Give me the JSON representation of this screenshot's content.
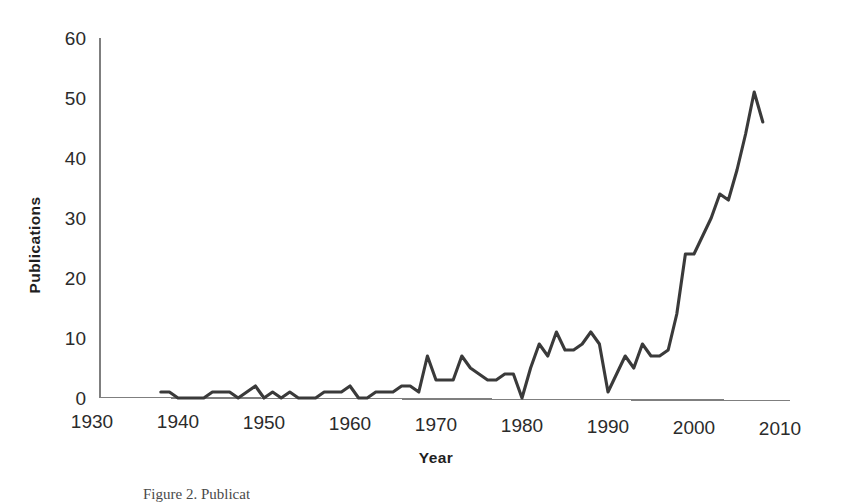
{
  "figure": {
    "caption": "Figure 2. Publicat",
    "background_color": "#ffffff"
  },
  "chart_data": {
    "type": "line",
    "title": "",
    "xlabel": "Year",
    "ylabel": "Publications",
    "xlim": [
      1930,
      2010
    ],
    "ylim": [
      0,
      60
    ],
    "grid": false,
    "legend": false,
    "line_color": "#3a3a3a",
    "axis_color": "#7f7f7f",
    "xticks": [
      1930,
      1940,
      1950,
      1960,
      1970,
      1980,
      1990,
      2000,
      2010
    ],
    "xtick_labels": [
      "1930",
      "1940",
      "1950",
      "1960",
      "1970",
      "1980",
      "1990",
      "2000",
      "2010"
    ],
    "yticks": [
      0,
      10,
      20,
      30,
      40,
      50,
      60
    ],
    "ytick_labels": [
      "0",
      "10",
      "20",
      "30",
      "40",
      "50",
      "60"
    ],
    "series": [
      {
        "name": "Publications",
        "x": [
          1938,
          1939,
          1940,
          1941,
          1942,
          1943,
          1944,
          1945,
          1946,
          1947,
          1948,
          1949,
          1950,
          1951,
          1952,
          1953,
          1954,
          1955,
          1956,
          1957,
          1958,
          1959,
          1960,
          1961,
          1962,
          1963,
          1964,
          1965,
          1966,
          1967,
          1968,
          1969,
          1970,
          1971,
          1972,
          1973,
          1974,
          1975,
          1976,
          1977,
          1978,
          1979,
          1980,
          1981,
          1982,
          1983,
          1984,
          1985,
          1986,
          1987,
          1988,
          1989,
          1990,
          1991,
          1992,
          1993,
          1994,
          1995,
          1996,
          1997,
          1998,
          1999,
          2000,
          2001,
          2002,
          2003,
          2004,
          2005,
          2006,
          2007,
          2008
        ],
        "values": [
          1,
          1,
          0,
          0,
          0,
          0,
          1,
          1,
          1,
          0,
          1,
          2,
          0,
          1,
          0,
          1,
          0,
          0,
          0,
          1,
          1,
          1,
          2,
          0,
          0,
          1,
          1,
          1,
          2,
          2,
          1,
          7,
          3,
          3,
          3,
          7,
          5,
          4,
          3,
          3,
          4,
          4,
          0,
          5,
          9,
          7,
          11,
          8,
          8,
          9,
          11,
          9,
          1,
          4,
          7,
          5,
          9,
          7,
          7,
          8,
          14,
          24,
          24,
          27,
          30,
          34,
          33,
          38,
          44,
          51,
          46
        ]
      }
    ]
  },
  "axes": {
    "x_title": "Year",
    "y_title": "Publications"
  }
}
